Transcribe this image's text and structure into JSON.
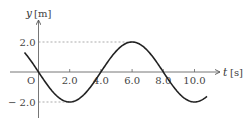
{
  "chart_data": {
    "type": "line",
    "title": "",
    "xlabel": "t",
    "xunit": "[s]",
    "ylabel": "y",
    "yunit": "[m]",
    "origin_label": "O",
    "xlim": [
      -1.0,
      11.0
    ],
    "ylim": [
      -3.0,
      3.0
    ],
    "x_ticks": [
      2.0,
      4.0,
      6.0,
      8.0,
      10.0
    ],
    "x_tick_labels": [
      "2.0",
      "4.0",
      "6.0",
      "8.0",
      "10.0"
    ],
    "y_ticks": [
      2.0,
      -2.0
    ],
    "y_tick_labels": [
      "2.0",
      "-2.0"
    ],
    "grid": false,
    "reference_lines": [
      {
        "type": "dashed",
        "y": 2.0,
        "from_x": 0,
        "to_x": 6.0
      },
      {
        "type": "dashed",
        "y": -2.0,
        "from_x": 0,
        "to_x": 2.0
      }
    ],
    "series": [
      {
        "name": "y(t)",
        "function": "y = -2.0 * sin(2*pi*t/8.0)",
        "amplitude": 2.0,
        "period": 8.0,
        "t_range": [
          -0.9,
          10.8
        ],
        "key_points": [
          {
            "t": 0.0,
            "y": 0.0
          },
          {
            "t": 2.0,
            "y": -2.0
          },
          {
            "t": 4.0,
            "y": 0.0
          },
          {
            "t": 6.0,
            "y": 2.0
          },
          {
            "t": 8.0,
            "y": 0.0
          },
          {
            "t": 10.0,
            "y": -2.0
          }
        ]
      }
    ]
  }
}
